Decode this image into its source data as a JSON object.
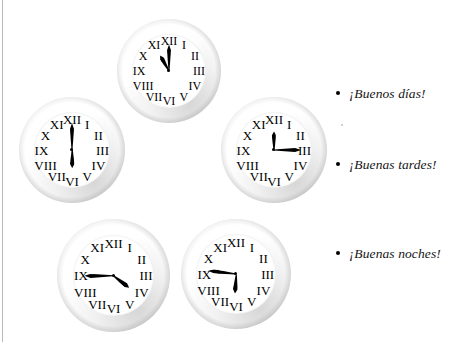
{
  "page": {
    "width": 476,
    "height": 342,
    "background": "#ffffff",
    "rule_color": "#b9b9bd"
  },
  "clock_numerals": [
    "XII",
    "I",
    "II",
    "III",
    "IV",
    "V",
    "VI",
    "VII",
    "VIII",
    "IX",
    "X",
    "XI"
  ],
  "clocks": [
    {
      "id": "clock-top",
      "label": "clock-eleven-o-clock",
      "time_text": "11:00",
      "hour": 11,
      "minute": 0,
      "hour_angle": 330,
      "minute_angle": 0,
      "left": 117,
      "top": 19,
      "size": 104
    },
    {
      "id": "clock-left",
      "label": "clock-six-o-clock",
      "time_text": "6:00",
      "hour": 6,
      "minute": 0,
      "hour_angle": 180,
      "minute_angle": 0,
      "left": 19,
      "top": 97,
      "size": 106
    },
    {
      "id": "clock-right",
      "label": "clock-twelve-fifteen",
      "time_text": "12:15",
      "hour": 12,
      "minute": 15,
      "hour_angle": 0,
      "minute_angle": 90,
      "left": 221,
      "top": 97,
      "size": 106
    },
    {
      "id": "clock-bottom-left",
      "label": "clock-four-forty-five",
      "time_text": "4:45",
      "hour": 4,
      "minute": 45,
      "hour_angle": 127,
      "minute_angle": 270,
      "left": 57,
      "top": 219,
      "size": 113
    },
    {
      "id": "clock-bottom-right",
      "label": "clock-six-forty-five",
      "time_text": "6:45",
      "hour": 6,
      "minute": 45,
      "hour_angle": 184,
      "minute_angle": 277,
      "left": 181,
      "top": 219,
      "size": 110
    }
  ],
  "greetings": {
    "items": [
      {
        "text": "¡Buenos días!",
        "top": 10
      },
      {
        "text": "¡Buenas tardes!",
        "top": 81
      },
      {
        "text": "¡Buenas noches!",
        "top": 170
      }
    ]
  }
}
